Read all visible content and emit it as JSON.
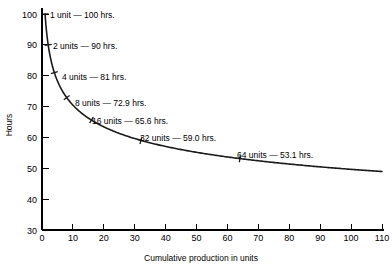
{
  "chart_data": {
    "type": "line",
    "title": "",
    "subtitle": "",
    "xlabel": "Cumulative production in units",
    "ylabel": "Hours",
    "xlim": [
      0,
      110
    ],
    "ylim": [
      30,
      100
    ],
    "xticks": [
      0,
      10,
      20,
      30,
      40,
      50,
      60,
      70,
      80,
      90,
      100,
      110
    ],
    "yticks": [
      30,
      40,
      50,
      60,
      70,
      80,
      90,
      100
    ],
    "xtick_labels": [
      "0",
      "10",
      "20",
      "30",
      "40",
      "50",
      "60",
      "70",
      "80",
      "90",
      "100",
      "110"
    ],
    "ytick_labels": [
      "30",
      "40",
      "50",
      "60",
      "70",
      "80",
      "90",
      "100"
    ],
    "grid": false,
    "legend": false,
    "series": [
      {
        "name": "90% learning curve",
        "color": "#1a1a1a",
        "x": [
          1,
          2,
          4,
          8,
          16,
          32,
          64,
          110
        ],
        "y": [
          100,
          90,
          81,
          72.9,
          65.6,
          59.0,
          53.1,
          49.2
        ]
      }
    ],
    "labeled_points": [
      {
        "units": 1,
        "hours": 100,
        "label": "1 unit — 100 hrs."
      },
      {
        "units": 2,
        "hours": 90,
        "label": "2 units — 90 hrs."
      },
      {
        "units": 4,
        "hours": 81,
        "label": "4 units — 81 hrs."
      },
      {
        "units": 8,
        "hours": 72.9,
        "label": "8 units — 72.9 hrs."
      },
      {
        "units": 16,
        "hours": 65.6,
        "label": "16 units — 65.6 hrs."
      },
      {
        "units": 32,
        "hours": 59.0,
        "label": "32 units — 59.0 hrs."
      },
      {
        "units": 64,
        "hours": 53.1,
        "label": "64 units — 53.1 hrs."
      }
    ],
    "annotations": [
      {
        "name": "label-1-unit",
        "text": "1 unit — 100 hrs.",
        "x_px": 50,
        "y_px": 18
      },
      {
        "name": "label-2-units",
        "text": "2 units — 90 hrs.",
        "x_px": 53,
        "y_px": 49
      },
      {
        "name": "label-4-units",
        "text": "4 units — 81 hrs.",
        "x_px": 62,
        "y_px": 80
      },
      {
        "name": "label-8-units",
        "text": "8 units — 72.9 hrs.",
        "x_px": 75,
        "y_px": 106
      },
      {
        "name": "label-16-units",
        "text": "16 units — 65.6 hrs.",
        "x_px": 92,
        "y_px": 124
      },
      {
        "name": "label-32-units",
        "text": "32 units — 59.0 hrs.",
        "x_px": 140,
        "y_px": 141
      },
      {
        "name": "label-64-units",
        "text": "64 units — 53.1 hrs.",
        "x_px": 237,
        "y_px": 158
      }
    ],
    "point_markers": [
      {
        "name": "marker-1-unit",
        "units": 1,
        "hours": 100
      },
      {
        "name": "marker-2-units",
        "units": 2,
        "hours": 90
      },
      {
        "name": "marker-4-units",
        "units": 4,
        "hours": 81
      },
      {
        "name": "marker-8-units",
        "units": 8,
        "hours": 72.9
      },
      {
        "name": "marker-16-units",
        "units": 16,
        "hours": 65.6
      },
      {
        "name": "marker-32-units",
        "units": 32,
        "hours": 59.0
      },
      {
        "name": "marker-64-units",
        "units": 64,
        "hours": 53.1
      }
    ],
    "colors": {
      "curve": "#1a1a1a",
      "axis": "#000000",
      "text": "#000000",
      "background": "#ffffff"
    }
  }
}
